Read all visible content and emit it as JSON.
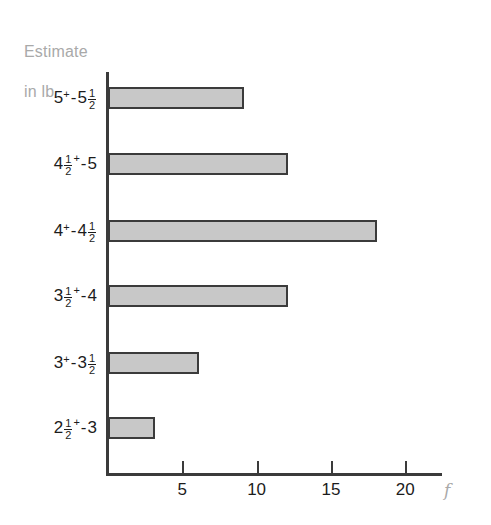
{
  "chart_data": {
    "type": "bar",
    "orientation": "horizontal",
    "title": "",
    "xlabel": "f",
    "ylabel": "Estimate in lb",
    "categories": [
      "2½⁺-3",
      "3⁺-3½",
      "3½⁺-4",
      "4⁺-4½",
      "4½⁺-5",
      "5⁺-5½"
    ],
    "values": [
      3,
      6,
      12,
      18,
      12,
      9
    ],
    "xlim": [
      0,
      22.5
    ],
    "xticks": [
      5,
      10,
      15,
      20
    ],
    "xtick_labels": [
      "5",
      "10",
      "15",
      "20"
    ],
    "grid": false,
    "legend": false,
    "bar_fill_color": "#c8c8c8",
    "bar_border_color": "#3b3b3b",
    "axis_color": "#3b3b3b",
    "label_color": "#1c1c1c",
    "axis_title_color": "#a9a9a9"
  },
  "axis_title": {
    "line1": "Estimate",
    "line2": "in lb"
  },
  "x_axis": {
    "ticks": [
      {
        "label": "5",
        "value": 5
      },
      {
        "label": "10",
        "value": 10
      },
      {
        "label": "15",
        "value": 15
      },
      {
        "label": "20",
        "value": 20
      }
    ],
    "unit_label": "f"
  },
  "bars": [
    {
      "category_label": "5⁺-5½",
      "value": 9,
      "parts": {
        "whole1": "5",
        "sup1": "+",
        "dash": "-",
        "whole2": "5",
        "num": "1",
        "den": "2"
      },
      "layout": "sup-after-first"
    },
    {
      "category_label": "4½⁺-5",
      "value": 12,
      "parts": {
        "whole1": "4",
        "num": "1",
        "den": "2",
        "sup1": "+",
        "dash": "-",
        "whole2": "5"
      },
      "layout": "sup-after-frac-first"
    },
    {
      "category_label": "4⁺-4½",
      "value": 18,
      "parts": {
        "whole1": "4",
        "sup1": "+",
        "dash": "-",
        "whole2": "4",
        "num": "1",
        "den": "2"
      },
      "layout": "sup-after-first"
    },
    {
      "category_label": "3½⁺-4",
      "value": 12,
      "parts": {
        "whole1": "3",
        "num": "1",
        "den": "2",
        "sup1": "+",
        "dash": "-",
        "whole2": "4"
      },
      "layout": "sup-after-frac-first"
    },
    {
      "category_label": "3⁺-3½",
      "value": 6,
      "parts": {
        "whole1": "3",
        "sup1": "+",
        "dash": "-",
        "whole2": "3",
        "num": "1",
        "den": "2"
      },
      "layout": "sup-after-first"
    },
    {
      "category_label": "2½⁺-3",
      "value": 3,
      "parts": {
        "whole1": "2",
        "num": "1",
        "den": "2",
        "sup1": "+",
        "dash": "-",
        "whole2": "3"
      },
      "layout": "sup-after-frac-first"
    }
  ]
}
